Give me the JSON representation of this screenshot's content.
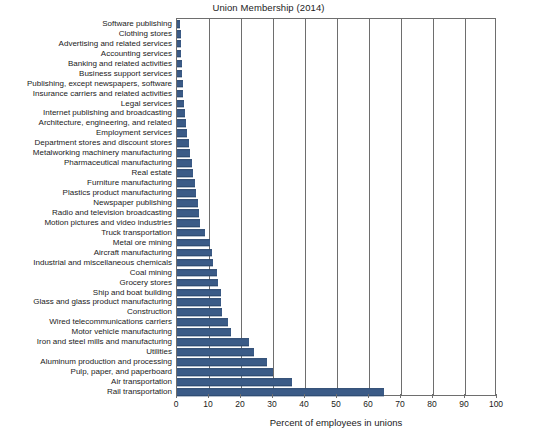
{
  "chart_data": {
    "type": "bar",
    "orientation": "horizontal",
    "title": "Union Membership (2014)",
    "xlabel": "Percent of employees in unions",
    "ylabel": "",
    "xlim": [
      0,
      100
    ],
    "xticks": [
      0,
      10,
      20,
      30,
      40,
      50,
      60,
      70,
      80,
      90,
      100
    ],
    "grid": true,
    "legend": null,
    "bar_color": "#3b5b87",
    "categories": [
      "Software publishing",
      "Clothing stores",
      "Advertising and related services",
      "Accounting services",
      "Banking and related activities",
      "Business support services",
      "Publishing, except newspapers, software",
      "Insurance carriers and related activities",
      "Legal services",
      "Internet publishing and broadcasting",
      "Architecture, engineering, and related",
      "Employment services",
      "Department stores and discount stores",
      "Metalworking machinery manufacturing",
      "Pharmaceutical manufacturing",
      "Real estate",
      "Furniture manufacturing",
      "Plastics product manufacturing",
      "Newspaper publishing",
      "Radio and television broadcasting",
      "Motion pictures and video industries",
      "Truck transportation",
      "Metal ore mining",
      "Aircraft manufacturing",
      "Industrial and miscellaneous chemicals",
      "Coal mining",
      "Grocery stores",
      "Ship and boat building",
      "Glass and glass product manufacturing",
      "Construction",
      "Wired telecommunications carriers",
      "Motor vehicle manufacturing",
      "Iron and steel mills and manufacturing",
      "Utilities",
      "Aluminum production and processing",
      "Pulp, paper, and paperboard",
      "Air transportation",
      "Rail transportation"
    ],
    "values": [
      1.0,
      1.1,
      1.3,
      1.4,
      1.5,
      1.6,
      1.8,
      2.0,
      2.2,
      2.5,
      2.8,
      3.1,
      3.6,
      4.2,
      4.6,
      5.0,
      5.5,
      5.8,
      6.6,
      6.8,
      7.2,
      8.6,
      10.4,
      11.0,
      11.2,
      12.6,
      12.8,
      13.6,
      13.8,
      14.0,
      16.0,
      17.0,
      22.4,
      24.0,
      28.0,
      30.0,
      36.0,
      64.7
    ]
  }
}
